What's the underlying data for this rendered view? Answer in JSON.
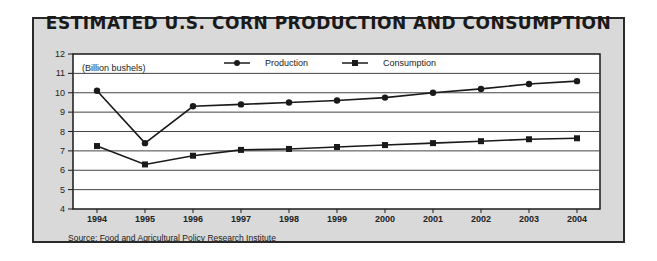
{
  "chart_data": {
    "type": "line",
    "title": "ESTIMATED U.S. CORN PRODUCTION AND CONSUMPTION",
    "unit_label": "(Billion bushels)",
    "xlabel": "",
    "ylabel": "Billion bushels",
    "x": [
      "1994",
      "1995",
      "1996",
      "1997",
      "1998",
      "1999",
      "2000",
      "2001",
      "2002",
      "2003",
      "2004"
    ],
    "ylim": [
      4,
      12
    ],
    "yticks": [
      4,
      5,
      6,
      7,
      8,
      9,
      10,
      11,
      12
    ],
    "grid": true,
    "legend_position": "top-center",
    "series": [
      {
        "name": "Production",
        "marker": "circle",
        "values": [
          10.1,
          7.4,
          9.3,
          9.4,
          9.5,
          9.6,
          9.75,
          10.0,
          10.2,
          10.45,
          10.6
        ]
      },
      {
        "name": "Consumption",
        "marker": "square",
        "values": [
          7.25,
          6.3,
          6.75,
          7.05,
          7.1,
          7.2,
          7.3,
          7.4,
          7.5,
          7.6,
          7.65
        ]
      }
    ],
    "source": "Source: Food and Agricultural Policy Research Institute"
  },
  "colors": {
    "frame_bg": "#d9d9d9",
    "plot_bg": "#ffffff",
    "line": "#1a1a1a",
    "grid": "#444444"
  }
}
